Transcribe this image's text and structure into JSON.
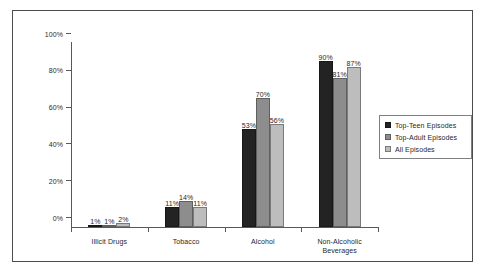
{
  "chart_data": {
    "type": "bar",
    "title": "",
    "subtitle": "",
    "xlabel": "",
    "ylabel": "",
    "ylim": [
      0,
      100
    ],
    "yticks": [
      "0%",
      "20%",
      "40%",
      "60%",
      "80%",
      "100%"
    ],
    "ytick_values": [
      0,
      20,
      40,
      60,
      80,
      100
    ],
    "grid": false,
    "legend_position": "right",
    "categories": [
      "Illicit Drugs",
      "Tobacco",
      "Alcohol",
      "Non-Alcoholic\nBeverages"
    ],
    "series": [
      {
        "name": "Top-Teen Episodes",
        "color": "#232323",
        "values": [
          1,
          11,
          53,
          90
        ],
        "labels": [
          "1%",
          "11%",
          "53%",
          "90%"
        ]
      },
      {
        "name": "Top-Adult Episodes",
        "color": "#8d8d8d",
        "values": [
          1,
          14,
          70,
          81
        ],
        "labels": [
          "1%",
          "14%",
          "70%",
          "81%"
        ]
      },
      {
        "name": "All Episodes",
        "color": "#bdbdbd",
        "values": [
          2,
          11,
          56,
          87
        ],
        "labels": [
          "2%",
          "11%",
          "56%",
          "87%"
        ]
      }
    ]
  },
  "legend": {
    "items": [
      {
        "label": "Top-Teen Episodes"
      },
      {
        "label": "Top-Adult Episodes"
      },
      {
        "label": "All Episodes"
      }
    ]
  }
}
